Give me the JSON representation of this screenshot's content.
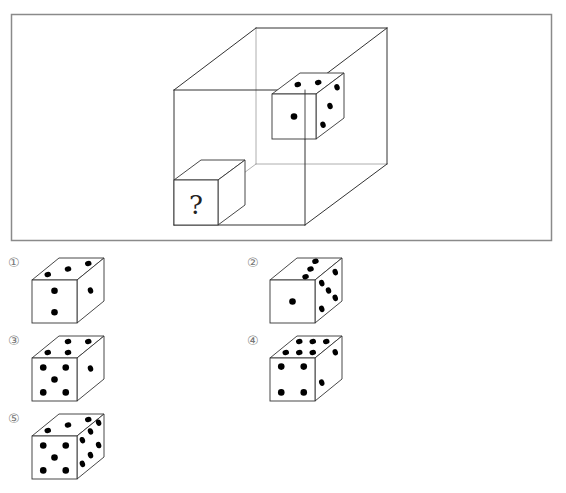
{
  "question": {
    "unknown_face_text": "?",
    "colors": {
      "line": "#333333",
      "back_line": "#9a9a9a",
      "frame": "#8a8a8a",
      "pip": "#000000"
    },
    "container_cube": {
      "description": "wireframe cube containing two dice"
    },
    "known_die": {
      "faces": {
        "front": {
          "count": 1,
          "pips": [
            [
              0.5,
              0.5
            ]
          ]
        },
        "top": {
          "count": 2,
          "pips": [
            [
              0.3,
              0.55
            ],
            [
              0.7,
              0.45
            ]
          ]
        },
        "right": {
          "count": 3,
          "pips": [
            [
              0.75,
              0.2
            ],
            [
              0.5,
              0.5
            ],
            [
              0.25,
              0.8
            ]
          ]
        }
      }
    },
    "unknown_die": {
      "front_label": "?"
    }
  },
  "options": [
    {
      "label": "①",
      "faces": {
        "front": {
          "count": 2,
          "pips": [
            [
              0.5,
              0.25
            ],
            [
              0.5,
              0.75
            ]
          ]
        },
        "top": {
          "count": 3,
          "pips": [
            [
              0.2,
              0.75
            ],
            [
              0.5,
              0.5
            ],
            [
              0.8,
              0.25
            ]
          ]
        },
        "right": {
          "count": 1,
          "pips": [
            [
              0.5,
              0.5
            ]
          ]
        }
      }
    },
    {
      "label": "②",
      "faces": {
        "front": {
          "count": 1,
          "pips": [
            [
              0.5,
              0.5
            ]
          ]
        },
        "top": {
          "count": 3,
          "pips": [
            [
              0.5,
              0.15
            ],
            [
              0.6,
              0.5
            ],
            [
              0.7,
              0.85
            ]
          ]
        },
        "right": {
          "count": 5,
          "pips": [
            [
              0.25,
              0.2
            ],
            [
              0.75,
              0.2
            ],
            [
              0.5,
              0.5
            ],
            [
              0.25,
              0.8
            ],
            [
              0.75,
              0.8
            ]
          ]
        }
      }
    },
    {
      "label": "③",
      "faces": {
        "front": {
          "count": 5,
          "pips": [
            [
              0.25,
              0.22
            ],
            [
              0.75,
              0.22
            ],
            [
              0.5,
              0.5
            ],
            [
              0.25,
              0.8
            ],
            [
              0.75,
              0.8
            ]
          ]
        },
        "top": {
          "count": 4,
          "pips": [
            [
              0.2,
              0.75
            ],
            [
              0.65,
              0.75
            ],
            [
              0.35,
              0.25
            ],
            [
              0.8,
              0.25
            ]
          ]
        },
        "right": {
          "count": 1,
          "pips": [
            [
              0.5,
              0.5
            ]
          ]
        }
      }
    },
    {
      "label": "④",
      "faces": {
        "front": {
          "count": 4,
          "pips": [
            [
              0.25,
              0.2
            ],
            [
              0.75,
              0.2
            ],
            [
              0.25,
              0.8
            ],
            [
              0.75,
              0.8
            ]
          ]
        },
        "top": {
          "count": 6,
          "pips": [
            [
              0.2,
              0.75
            ],
            [
              0.5,
              0.75
            ],
            [
              0.8,
              0.75
            ],
            [
              0.2,
              0.25
            ],
            [
              0.5,
              0.25
            ],
            [
              0.8,
              0.25
            ]
          ]
        },
        "right": {
          "count": 2,
          "pips": [
            [
              0.75,
              0.25
            ],
            [
              0.25,
              0.7
            ]
          ]
        }
      }
    },
    {
      "label": "⑤",
      "faces": {
        "front": {
          "count": 5,
          "pips": [
            [
              0.25,
              0.22
            ],
            [
              0.75,
              0.22
            ],
            [
              0.5,
              0.5
            ],
            [
              0.25,
              0.8
            ],
            [
              0.75,
              0.8
            ]
          ]
        },
        "top": {
          "count": 3,
          "pips": [
            [
              0.2,
              0.75
            ],
            [
              0.5,
              0.5
            ],
            [
              0.8,
              0.25
            ]
          ]
        },
        "right": {
          "count": 6,
          "pips": [
            [
              0.2,
              0.2
            ],
            [
              0.5,
              0.15
            ],
            [
              0.8,
              0.1
            ],
            [
              0.2,
              0.75
            ],
            [
              0.5,
              0.7
            ],
            [
              0.8,
              0.62
            ]
          ]
        }
      }
    }
  ]
}
